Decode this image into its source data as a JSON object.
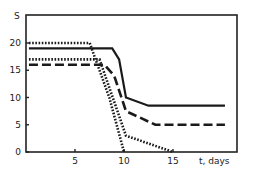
{
  "chart_data": {
    "type": "line",
    "title": "",
    "xlabel": "t, days",
    "ylabel": "S",
    "xlim": [
      0,
      21.5
    ],
    "ylim": [
      0,
      24
    ],
    "x_ticks": [
      5,
      10,
      15
    ],
    "y_ticks": [
      0,
      5,
      10,
      15,
      20
    ],
    "grid": false,
    "legend": null,
    "series": [
      {
        "name": "solid",
        "style": "solid",
        "x": [
          0.3,
          8.8,
          9.5,
          10.2,
          12.5,
          20.3
        ],
        "y": [
          19,
          19,
          17,
          10,
          8.5,
          8.5
        ]
      },
      {
        "name": "dashed",
        "style": "dashed",
        "x": [
          0.3,
          8.0,
          9.0,
          10.2,
          13.2,
          20.3
        ],
        "y": [
          16,
          16,
          14,
          7.5,
          5,
          5
        ]
      },
      {
        "name": "dotted-upper",
        "style": "dotted",
        "x": [
          0.3,
          6.5,
          8.5,
          10.0
        ],
        "y": [
          20,
          20,
          10,
          0
        ]
      },
      {
        "name": "dotted-lower",
        "style": "dotted",
        "x": [
          0.3,
          7.5,
          10.2,
          15.0
        ],
        "y": [
          17,
          17,
          3,
          0
        ]
      }
    ]
  },
  "axes": {
    "y_title": "S",
    "x_title": "t, days",
    "y_tick_labels": [
      "0",
      "5",
      "10",
      "15",
      "20"
    ],
    "x_tick_labels": [
      "5",
      "10",
      "15"
    ]
  }
}
